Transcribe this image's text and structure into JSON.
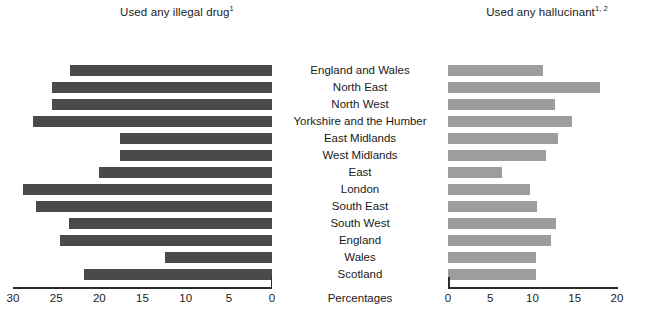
{
  "figure": {
    "axis_caption": "Percentages",
    "left_title": "Used any illegal drug",
    "left_title_sup": "1",
    "right_title": "Used any hallucinant",
    "right_title_sup": "1, 2"
  },
  "categories": [
    "England and Wales",
    "North East",
    "North West",
    "Yorkshire and the Humber",
    "East Midlands",
    "West Midlands",
    "East",
    "London",
    "South East",
    "South West",
    "England",
    "Wales",
    "Scotland"
  ],
  "left_ticks": [
    "30",
    "25",
    "20",
    "15",
    "10",
    "5",
    "0"
  ],
  "right_ticks": [
    "0",
    "5",
    "10",
    "15",
    "20"
  ],
  "colors": {
    "left_bar": "#4a4a4a",
    "right_bar": "#9d9d9d",
    "axis": "#2b2b2b",
    "text": "#1a1a1a",
    "background": "#ffffff"
  },
  "chart_data": {
    "type": "bar",
    "orientation": "horizontal",
    "layout": "back-to-back mirrored pair, shared centred category labels",
    "grid": false,
    "legend": false,
    "xlabel": "Percentages",
    "ylabel": "",
    "categories": [
      "England and Wales",
      "North East",
      "North West",
      "Yorkshire and the Humber",
      "East Midlands",
      "West Midlands",
      "East",
      "London",
      "South East",
      "South West",
      "England",
      "Wales",
      "Scotland"
    ],
    "series": [
      {
        "name": "Used any illegal drug",
        "panel": "left",
        "direction": "right-to-left",
        "xlim": [
          0,
          30
        ],
        "xticks": [
          30,
          25,
          20,
          15,
          10,
          5,
          0
        ],
        "color": "#4a4a4a",
        "values": [
          23.4,
          25.5,
          25.5,
          27.7,
          17.6,
          17.6,
          20.0,
          28.8,
          27.3,
          23.5,
          24.6,
          12.4,
          21.8
        ]
      },
      {
        "name": "Used any hallucinant",
        "panel": "right",
        "direction": "left-to-right",
        "xlim": [
          0,
          20
        ],
        "xticks": [
          0,
          5,
          10,
          15,
          20
        ],
        "color": "#9d9d9d",
        "values": [
          11.2,
          18.0,
          12.7,
          14.7,
          13.0,
          11.6,
          6.4,
          9.7,
          10.5,
          12.8,
          12.2,
          10.4,
          10.4
        ]
      }
    ]
  }
}
